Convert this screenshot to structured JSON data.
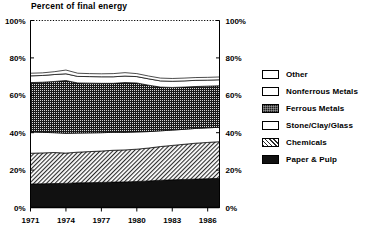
{
  "chart_data": {
    "type": "area",
    "title": "Percent of final energy",
    "subtitle": "",
    "xlabel": "",
    "ylabel": "",
    "stacked": true,
    "grid": false,
    "legend_position": "right",
    "ylim": [
      0,
      100
    ],
    "yticks": [
      0,
      20,
      40,
      60,
      80,
      100
    ],
    "ytick_labels": [
      "0%",
      "20%",
      "40%",
      "60%",
      "80%",
      "100%"
    ],
    "y_axis_right": true,
    "ytick_labels_right": [
      "0%",
      "20%",
      "40%",
      "60%",
      "80%",
      "100%"
    ],
    "xlim": [
      1971,
      1987
    ],
    "xticks": [
      1971,
      1974,
      1977,
      1980,
      1983,
      1986
    ],
    "xtick_labels": [
      "1971",
      "1974",
      "1977",
      "1980",
      "1983",
      "1986"
    ],
    "x": [
      1971,
      1972,
      1973,
      1974,
      1975,
      1976,
      1977,
      1978,
      1979,
      1980,
      1981,
      1982,
      1983,
      1984,
      1985,
      1986,
      1987
    ],
    "series": [
      {
        "name": "Paper & Pulp",
        "fill": "solid",
        "color": "#111111",
        "values": [
          12.6,
          12.7,
          12.8,
          12.9,
          13.2,
          13.3,
          13.4,
          13.6,
          13.7,
          13.9,
          14.2,
          14.6,
          14.8,
          15.0,
          15.2,
          15.4,
          15.6
        ]
      },
      {
        "name": "Chemicals",
        "fill": "hatch",
        "color": "#2b2b2b",
        "values": [
          16.4,
          16.5,
          16.6,
          16.2,
          16.4,
          16.6,
          16.8,
          17.0,
          17.1,
          17.3,
          17.6,
          18.0,
          18.4,
          18.8,
          19.2,
          19.4,
          19.6
        ]
      },
      {
        "name": "Stone/Clay/Glass",
        "fill": "blank",
        "color": "#ffffff",
        "values": [
          11.4,
          11.0,
          10.6,
          10.6,
          10.2,
          10.0,
          9.8,
          9.6,
          9.4,
          9.2,
          8.8,
          8.4,
          8.2,
          8.0,
          7.9,
          7.8,
          7.7
        ]
      },
      {
        "name": "Ferrous Metals",
        "fill": "stipple",
        "color": "#1b1b1b",
        "values": [
          26.4,
          26.8,
          27.4,
          28.2,
          26.8,
          26.6,
          26.4,
          26.2,
          26.6,
          26.2,
          24.8,
          23.4,
          22.8,
          22.6,
          22.4,
          22.3,
          22.2
        ]
      },
      {
        "name": "Nonferrous Metals",
        "fill": "blank",
        "color": "#ffffff",
        "values": [
          3.6,
          3.6,
          3.7,
          3.6,
          3.5,
          3.5,
          3.5,
          3.5,
          3.5,
          3.4,
          3.4,
          3.3,
          3.3,
          3.3,
          3.3,
          3.2,
          3.2
        ]
      },
      {
        "name": "Other",
        "fill": "blank",
        "color": "#ffffff",
        "values": [
          1.4,
          1.4,
          1.5,
          2.0,
          1.7,
          1.6,
          1.6,
          1.7,
          1.8,
          1.6,
          1.5,
          1.5,
          1.5,
          1.5,
          1.5,
          1.5,
          1.5
        ]
      }
    ],
    "stack_top_totals": [
      71.8,
      72.0,
      72.6,
      73.5,
      71.8,
      71.6,
      71.5,
      71.6,
      72.1,
      71.6,
      70.3,
      69.2,
      69.0,
      69.2,
      69.5,
      69.6,
      69.8
    ]
  },
  "legend": {
    "items": [
      {
        "label": "Other",
        "fill": "blank"
      },
      {
        "label": "Nonferrous Metals",
        "fill": "blank"
      },
      {
        "label": "Ferrous Metals",
        "fill": "stipple"
      },
      {
        "label": "Stone/Clay/Glass",
        "fill": "blank"
      },
      {
        "label": "Chemicals",
        "fill": "hatch"
      },
      {
        "label": "Paper & Pulp",
        "fill": "solid"
      }
    ]
  }
}
